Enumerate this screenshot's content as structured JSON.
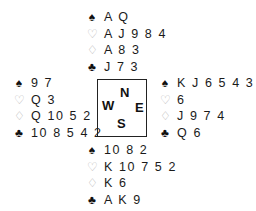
{
  "suits": {
    "spades": "♠",
    "hearts": "♡",
    "diamonds": "♢",
    "clubs": "♣"
  },
  "compass": {
    "north": "N",
    "west": "W",
    "east": "E",
    "south": "S"
  },
  "hands": {
    "north": {
      "spades": "A Q",
      "hearts": "A J 9 8 4",
      "diamonds": "A 8 3",
      "clubs": "J 7 3"
    },
    "west": {
      "spades": "9 7",
      "hearts": "Q 3",
      "diamonds": "Q 10 5 2",
      "clubs": "10 8 5 4 2"
    },
    "east": {
      "spades": "K J 6 5 4 3",
      "hearts": "6",
      "diamonds": "J 9 7 4",
      "clubs": "Q 6"
    },
    "south": {
      "spades": "10 8 2",
      "hearts": "K 10 7 5 2",
      "diamonds": "K 6",
      "clubs": "A K 9"
    }
  }
}
